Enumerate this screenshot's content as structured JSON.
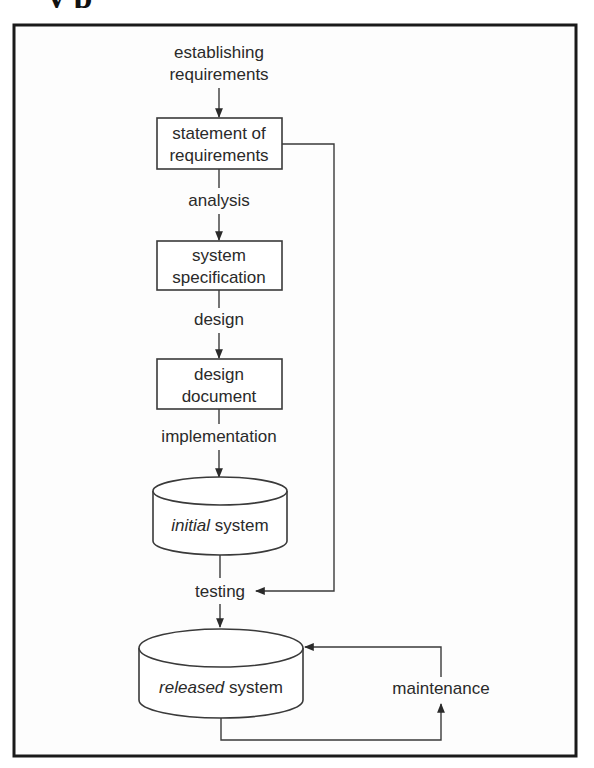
{
  "heading_fragment": "y   p",
  "diagram": {
    "activities": {
      "establishing": "establishing",
      "requirements": "requirements",
      "analysis": "analysis",
      "design": "design",
      "implementation": "implementation",
      "testing": "testing",
      "maintenance": "maintenance"
    },
    "documents": [
      {
        "line1": "statement of",
        "line2": "requirements"
      },
      {
        "line1": "system",
        "line2": "specification"
      },
      {
        "line1": "design",
        "line2": "document"
      }
    ],
    "systems": [
      {
        "prefix": "initial",
        "suffix": " system"
      },
      {
        "prefix": "released",
        "suffix": " system"
      }
    ],
    "colors": {
      "line": "#3a3a3a",
      "frame": "#1a1a1a",
      "text": "#2a2a2a",
      "background": "#ffffff"
    }
  }
}
